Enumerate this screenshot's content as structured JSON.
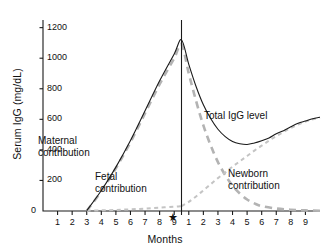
{
  "chart_data": {
    "type": "line",
    "title": "",
    "xlabel": "Months",
    "ylabel": "Serum IgG (mg/dL)",
    "ylim": [
      0,
      1250
    ],
    "yticks": [
      0,
      200,
      400,
      600,
      800,
      1000,
      1200
    ],
    "ytick_labels": [
      "0",
      "200",
      "400",
      "600",
      "800",
      "1000",
      "1200"
    ],
    "xlim": [
      0,
      19
    ],
    "xticks": [
      1,
      2,
      3,
      4,
      5,
      6,
      7,
      8,
      9,
      10,
      11,
      12,
      13,
      14,
      15,
      16,
      17,
      18
    ],
    "xtick_labels": [
      "1",
      "2",
      "3",
      "4",
      "5",
      "6",
      "7",
      "8",
      "9",
      "1",
      "2",
      "3",
      "4",
      "5",
      "6",
      "7",
      "8",
      "9"
    ],
    "grid": false,
    "legend": "inline-annotations",
    "birth_marker": {
      "label": "★",
      "x": 9.5,
      "name": "birth"
    },
    "birth_line_x": 9.5,
    "annotations": [
      {
        "name": "maternal-label",
        "text_lines": [
          "Maternal",
          "contribution"
        ],
        "x": 2.6,
        "y": 470
      },
      {
        "name": "fetal-label",
        "text_lines": [
          "Fetal",
          "contribution"
        ],
        "x": 5.0,
        "y": 215
      },
      {
        "name": "total-label",
        "text_lines": [
          "Total IgG level"
        ],
        "x": 11.2,
        "y": 660
      },
      {
        "name": "newborn-label",
        "text_lines": [
          "Newborn",
          "contribution"
        ],
        "x": 13.6,
        "y": 300
      }
    ],
    "series": [
      {
        "name": "Maternal contribution",
        "style": "dashed-thick",
        "color": "#b3b3b3",
        "points": [
          [
            3.0,
            0
          ],
          [
            4.0,
            130
          ],
          [
            5.0,
            280
          ],
          [
            6.0,
            450
          ],
          [
            7.0,
            640
          ],
          [
            8.0,
            830
          ],
          [
            9.0,
            1000
          ],
          [
            9.5,
            1090
          ],
          [
            10.0,
            900
          ],
          [
            10.5,
            720
          ],
          [
            11.0,
            560
          ],
          [
            11.5,
            430
          ],
          [
            12.0,
            320
          ],
          [
            12.5,
            235
          ],
          [
            13.0,
            165
          ],
          [
            13.5,
            115
          ],
          [
            14.0,
            75
          ],
          [
            14.5,
            50
          ],
          [
            15.0,
            32
          ],
          [
            16.0,
            16
          ],
          [
            17.0,
            8
          ],
          [
            18.0,
            4
          ],
          [
            19.0,
            2
          ]
        ]
      },
      {
        "name": "Fetal contribution",
        "style": "dashed-fine",
        "color": "#c4c4c4",
        "points": [
          [
            3.0,
            2
          ],
          [
            4.0,
            4
          ],
          [
            5.0,
            7
          ],
          [
            6.0,
            11
          ],
          [
            7.0,
            16
          ],
          [
            8.0,
            22
          ],
          [
            9.0,
            28
          ],
          [
            9.5,
            32
          ]
        ]
      },
      {
        "name": "Newborn contribution",
        "style": "dashed-fine",
        "color": "#c4c4c4",
        "points": [
          [
            9.5,
            32
          ],
          [
            10.0,
            60
          ],
          [
            10.5,
            95
          ],
          [
            11.0,
            135
          ],
          [
            11.5,
            175
          ],
          [
            12.0,
            215
          ],
          [
            12.5,
            252
          ],
          [
            13.0,
            290
          ],
          [
            13.5,
            325
          ],
          [
            14.0,
            360
          ],
          [
            14.5,
            395
          ],
          [
            15.0,
            428
          ],
          [
            15.5,
            460
          ],
          [
            16.0,
            490
          ],
          [
            16.5,
            518
          ],
          [
            17.0,
            543
          ],
          [
            17.5,
            566
          ],
          [
            18.0,
            585
          ],
          [
            18.5,
            600
          ],
          [
            19.0,
            612
          ]
        ]
      },
      {
        "name": "Total IgG level",
        "style": "solid",
        "color": "#1a1a1a",
        "points": [
          [
            3.0,
            2
          ],
          [
            4.0,
            134
          ],
          [
            5.0,
            287
          ],
          [
            6.0,
            461
          ],
          [
            7.0,
            656
          ],
          [
            8.0,
            852
          ],
          [
            9.0,
            1028
          ],
          [
            9.5,
            1120
          ],
          [
            10.0,
            960
          ],
          [
            10.5,
            815
          ],
          [
            11.0,
            695
          ],
          [
            11.5,
            605
          ],
          [
            12.0,
            535
          ],
          [
            12.5,
            487
          ],
          [
            13.0,
            455
          ],
          [
            13.5,
            440
          ],
          [
            14.0,
            435
          ],
          [
            14.5,
            445
          ],
          [
            15.0,
            460
          ],
          [
            15.5,
            478
          ],
          [
            16.0,
            506
          ],
          [
            16.5,
            526
          ],
          [
            17.0,
            551
          ],
          [
            17.5,
            574
          ],
          [
            18.0,
            589
          ],
          [
            18.5,
            604
          ],
          [
            19.0,
            614
          ]
        ]
      }
    ]
  }
}
